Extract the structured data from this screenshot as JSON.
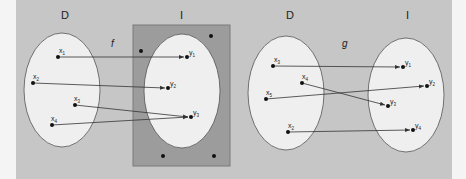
{
  "colors": {
    "page_bg": "#f4f4f4",
    "panel_bg": "#c6c6c6",
    "image_rect_fill": "#9c9c9c",
    "image_rect_stroke": "#7a7a7a",
    "ellipse_fill": "#efefef",
    "ellipse_stroke": "#555555",
    "arrow": "#333333",
    "dot": "#111111"
  },
  "diagrams": [
    {
      "name": "f",
      "function_label": "f",
      "domain_label": "D",
      "image_label": "I",
      "domain_points": [
        {
          "id": "x1",
          "base": "x",
          "sub": "1"
        },
        {
          "id": "x2",
          "base": "x",
          "sub": "2"
        },
        {
          "id": "x3",
          "base": "x",
          "sub": "3"
        },
        {
          "id": "x4",
          "base": "x",
          "sub": "4"
        }
      ],
      "image_points": [
        {
          "id": "y1",
          "base": "y",
          "sub": "1"
        },
        {
          "id": "y2",
          "base": "y",
          "sub": "2"
        },
        {
          "id": "y3",
          "base": "y",
          "sub": "3"
        }
      ],
      "mappings": [
        {
          "from": "x1",
          "to": "y1"
        },
        {
          "from": "x2",
          "to": "y2"
        },
        {
          "from": "x3",
          "to": "y3"
        },
        {
          "from": "x4",
          "to": "y3"
        }
      ],
      "codomain_extra_points": 4,
      "codomain_highlighted": true
    },
    {
      "name": "g",
      "function_label": "g",
      "domain_label": "D",
      "image_label": "I",
      "domain_points": [
        {
          "id": "x3",
          "base": "x",
          "sub": "3"
        },
        {
          "id": "x4",
          "base": "x",
          "sub": "4"
        },
        {
          "id": "x5",
          "base": "x",
          "sub": "5"
        },
        {
          "id": "x2",
          "base": "x",
          "sub": "2"
        }
      ],
      "image_points": [
        {
          "id": "y1",
          "base": "y",
          "sub": "1"
        },
        {
          "id": "y2",
          "base": "y",
          "sub": "2"
        },
        {
          "id": "y3",
          "base": "y",
          "sub": "3"
        },
        {
          "id": "y4",
          "base": "y",
          "sub": "4"
        }
      ],
      "mappings": [
        {
          "from": "x3",
          "to": "y1"
        },
        {
          "from": "x4",
          "to": "y3"
        },
        {
          "from": "x5",
          "to": "y2"
        },
        {
          "from": "x2",
          "to": "y4"
        }
      ],
      "codomain_extra_points": 0,
      "codomain_highlighted": false
    }
  ]
}
